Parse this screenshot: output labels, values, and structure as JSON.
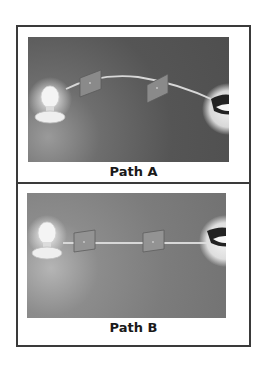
{
  "figure": {
    "panels": [
      {
        "id": "A",
        "caption": "Path A",
        "path_shape": "curved",
        "elements": [
          "light-bulb",
          "screen-with-hole",
          "screen-with-hole",
          "eye"
        ]
      },
      {
        "id": "B",
        "caption": "Path B",
        "path_shape": "straight",
        "elements": [
          "light-bulb",
          "screen-with-hole",
          "screen-with-hole",
          "eye"
        ]
      }
    ],
    "colors": {
      "border": "#3a3a3a",
      "panel_a_bg": "#555555",
      "panel_b_bg": "#7c7c7c",
      "light_ray": "#d8d8d8",
      "screen": "#8a8a8a"
    }
  }
}
